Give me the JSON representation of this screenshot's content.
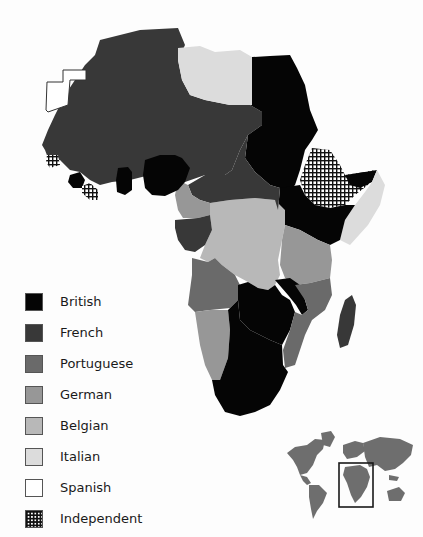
{
  "map": {
    "title": "Colonial Africa",
    "colors": {
      "British": "#050505",
      "French": "#383838",
      "Portuguese": "#6a6a6a",
      "German": "#979797",
      "Belgian": "#b8b8b8",
      "Italian": "#dcdcdc",
      "Spanish": "#ffffff",
      "Independent": "pattern-grid"
    }
  },
  "legend": {
    "items": [
      {
        "label": "British",
        "color": "#050505"
      },
      {
        "label": "French",
        "color": "#383838"
      },
      {
        "label": "Portuguese",
        "color": "#6a6a6a"
      },
      {
        "label": "German",
        "color": "#979797"
      },
      {
        "label": "Belgian",
        "color": "#b8b8b8"
      },
      {
        "label": "Italian",
        "color": "#dcdcdc"
      },
      {
        "label": "Spanish",
        "color": "#ffffff"
      },
      {
        "label": "Independent",
        "color": "pattern-grid"
      }
    ]
  },
  "inset": {
    "name": "world-locator-map",
    "highlight": "Africa"
  }
}
